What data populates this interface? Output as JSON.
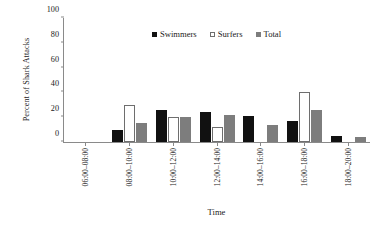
{
  "chart_data": {
    "type": "bar",
    "title": "",
    "xlabel": "Time",
    "ylabel": "Percent of Shark Attacks",
    "ylim": [
      0,
      100
    ],
    "yticks": [
      0,
      20,
      40,
      60,
      80,
      100
    ],
    "grid": false,
    "legend_position": "top-center",
    "categories": [
      "06:00–08:00",
      "08:00–10:00",
      "10:00–12:00",
      "12:00–14:00",
      "14:00–16:00",
      "16:00–18:00",
      "18:00–20:00"
    ],
    "series": [
      {
        "name": "Swimmers",
        "color": "#111111",
        "values": [
          0,
          10,
          26,
          24,
          21,
          17,
          5
        ]
      },
      {
        "name": "Surfers",
        "color": "#ffffff",
        "values": [
          0,
          30,
          20,
          12,
          0,
          40,
          0
        ]
      },
      {
        "name": "Total",
        "color": "#7d7d7d",
        "values": [
          0,
          15,
          20,
          22,
          14,
          26,
          4
        ]
      }
    ]
  },
  "legend": {
    "items": [
      {
        "label": "Swimmers",
        "swatch": "filled-black-square-icon"
      },
      {
        "label": "Surfers",
        "swatch": "open-white-square-icon"
      },
      {
        "label": "Total",
        "swatch": "filled-gray-square-icon"
      }
    ]
  }
}
